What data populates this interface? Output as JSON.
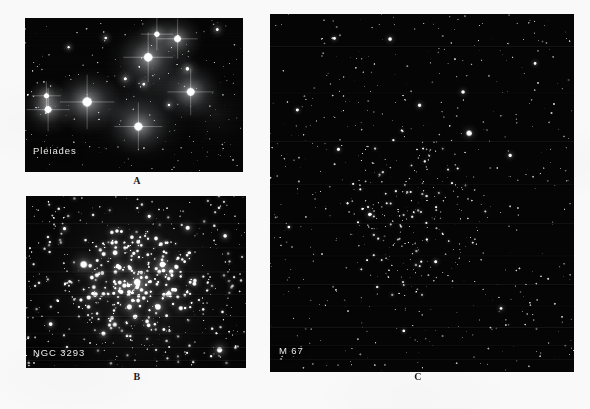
{
  "figure": {
    "kind": "astronomical-plate",
    "page_background": "#f9f9fa",
    "panel_background": "#050505",
    "label_color": "#e8e8e6",
    "caption_color": "#1c1c1c"
  },
  "panels": [
    {
      "id": "a",
      "object_label": "Pleiades",
      "caption": "A",
      "appearance": "bright blue-white stars wreathed in diffuse reflection nebulosity",
      "geometry": {
        "x": 25,
        "y": 18,
        "width": 218,
        "height": 154
      }
    },
    {
      "id": "b",
      "object_label": "NGC 3293",
      "caption": "B",
      "appearance": "rich compact open cluster, dense bright core, many resolved stars",
      "geometry": {
        "x": 26,
        "y": 196,
        "width": 220,
        "height": 172
      }
    },
    {
      "id": "c",
      "object_label": "M 67",
      "caption": "C",
      "appearance": "loose sparse old open cluster of faint pinpoint stars on dark field",
      "geometry": {
        "x": 270,
        "y": 14,
        "width": 304,
        "height": 358
      }
    }
  ],
  "starfields": {
    "pleiades": {
      "seed": 20231,
      "field_stars": 210,
      "nebulosity_opacity": 0.62,
      "bright_stars": [
        {
          "x": 0.285,
          "y": 0.545,
          "r": 5.4,
          "halo": 34,
          "spikes": true
        },
        {
          "x": 0.106,
          "y": 0.595,
          "r": 4.1,
          "halo": 27,
          "spikes": true
        },
        {
          "x": 0.098,
          "y": 0.505,
          "r": 2.9,
          "halo": 18,
          "spikes": true
        },
        {
          "x": 0.565,
          "y": 0.255,
          "r": 5.0,
          "halo": 31,
          "spikes": true
        },
        {
          "x": 0.605,
          "y": 0.105,
          "r": 3.2,
          "halo": 20,
          "spikes": true
        },
        {
          "x": 0.7,
          "y": 0.135,
          "r": 4.1,
          "halo": 25,
          "spikes": true
        },
        {
          "x": 0.76,
          "y": 0.48,
          "r": 4.6,
          "halo": 29,
          "spikes": true
        },
        {
          "x": 0.745,
          "y": 0.33,
          "r": 2.2,
          "halo": 13,
          "spikes": false
        },
        {
          "x": 0.52,
          "y": 0.705,
          "r": 4.8,
          "halo": 30,
          "spikes": true
        },
        {
          "x": 0.46,
          "y": 0.395,
          "r": 1.9,
          "halo": 10,
          "spikes": false
        },
        {
          "x": 0.545,
          "y": 0.43,
          "r": 1.7,
          "halo": 9,
          "spikes": false
        },
        {
          "x": 0.37,
          "y": 0.13,
          "r": 1.6,
          "halo": 8,
          "spikes": false
        },
        {
          "x": 0.2,
          "y": 0.19,
          "r": 1.5,
          "halo": 7,
          "spikes": false
        },
        {
          "x": 0.882,
          "y": 0.075,
          "r": 1.8,
          "halo": 9,
          "spikes": false
        },
        {
          "x": 0.66,
          "y": 0.565,
          "r": 1.6,
          "halo": 8,
          "spikes": false
        }
      ],
      "nebula_blobs": [
        {
          "x": 0.285,
          "y": 0.545,
          "rx": 0.17,
          "ry": 0.2,
          "a": 0.42
        },
        {
          "x": 0.565,
          "y": 0.265,
          "rx": 0.2,
          "ry": 0.24,
          "a": 0.4
        },
        {
          "x": 0.54,
          "y": 0.7,
          "rx": 0.21,
          "ry": 0.24,
          "a": 0.38
        },
        {
          "x": 0.76,
          "y": 0.47,
          "rx": 0.16,
          "ry": 0.19,
          "a": 0.34
        },
        {
          "x": 0.105,
          "y": 0.565,
          "rx": 0.13,
          "ry": 0.16,
          "a": 0.3
        },
        {
          "x": 0.69,
          "y": 0.14,
          "rx": 0.14,
          "ry": 0.16,
          "a": 0.28
        },
        {
          "x": 0.62,
          "y": 0.45,
          "rx": 0.3,
          "ry": 0.33,
          "a": 0.16
        },
        {
          "x": 0.43,
          "y": 0.6,
          "rx": 0.28,
          "ry": 0.26,
          "a": 0.12
        },
        {
          "x": 0.87,
          "y": 0.62,
          "rx": 0.18,
          "ry": 0.22,
          "a": 0.12
        }
      ]
    },
    "ngc3293": {
      "seed": 771,
      "field_stars": 430,
      "core": {
        "x": 0.505,
        "y": 0.505,
        "radius": 0.27,
        "count": 170
      },
      "bright_stars": [
        {
          "x": 0.505,
          "y": 0.5,
          "r": 4.0,
          "halo": 14
        },
        {
          "x": 0.262,
          "y": 0.398,
          "r": 4.3,
          "halo": 15
        },
        {
          "x": 0.62,
          "y": 0.398,
          "r": 3.5,
          "halo": 12
        },
        {
          "x": 0.6,
          "y": 0.645,
          "r": 3.6,
          "halo": 12
        },
        {
          "x": 0.47,
          "y": 0.645,
          "r": 3.2,
          "halo": 11
        },
        {
          "x": 0.405,
          "y": 0.33,
          "r": 3.0,
          "halo": 10
        },
        {
          "x": 0.66,
          "y": 0.44,
          "r": 2.8,
          "halo": 10
        },
        {
          "x": 0.88,
          "y": 0.895,
          "r": 3.4,
          "halo": 12
        },
        {
          "x": 0.352,
          "y": 0.8,
          "r": 2.6,
          "halo": 9
        },
        {
          "x": 0.735,
          "y": 0.185,
          "r": 2.6,
          "halo": 9
        },
        {
          "x": 0.112,
          "y": 0.745,
          "r": 2.4,
          "halo": 8
        },
        {
          "x": 0.905,
          "y": 0.232,
          "r": 2.3,
          "halo": 8
        },
        {
          "x": 0.175,
          "y": 0.19,
          "r": 2.1,
          "halo": 7
        },
        {
          "x": 0.56,
          "y": 0.118,
          "r": 2.0,
          "halo": 7
        }
      ]
    },
    "m67": {
      "seed": 4457,
      "field_stars": 560,
      "core": {
        "x": 0.47,
        "y": 0.56,
        "radius": 0.24,
        "count": 190
      },
      "bright_stars": [
        {
          "x": 0.655,
          "y": 0.333,
          "r": 3.6,
          "halo": 10
        },
        {
          "x": 0.395,
          "y": 0.07,
          "r": 2.4,
          "halo": 7
        },
        {
          "x": 0.635,
          "y": 0.218,
          "r": 2.3,
          "halo": 7
        },
        {
          "x": 0.492,
          "y": 0.255,
          "r": 2.2,
          "halo": 7
        },
        {
          "x": 0.79,
          "y": 0.395,
          "r": 2.2,
          "halo": 7
        },
        {
          "x": 0.225,
          "y": 0.378,
          "r": 2.1,
          "halo": 6
        },
        {
          "x": 0.328,
          "y": 0.56,
          "r": 2.2,
          "halo": 7
        },
        {
          "x": 0.09,
          "y": 0.268,
          "r": 2.0,
          "halo": 6
        },
        {
          "x": 0.872,
          "y": 0.138,
          "r": 1.9,
          "halo": 6
        },
        {
          "x": 0.545,
          "y": 0.692,
          "r": 2.0,
          "halo": 6
        },
        {
          "x": 0.212,
          "y": 0.068,
          "r": 1.9,
          "halo": 6
        },
        {
          "x": 0.76,
          "y": 0.822,
          "r": 1.9,
          "halo": 6
        },
        {
          "x": 0.44,
          "y": 0.885,
          "r": 1.8,
          "halo": 5
        },
        {
          "x": 0.062,
          "y": 0.595,
          "r": 1.8,
          "halo": 5
        }
      ]
    }
  },
  "scanlines": {
    "panel_b": [
      0.16,
      0.3,
      0.44,
      0.57,
      0.7,
      0.8,
      0.88,
      0.955
    ],
    "panel_c": [
      0.09,
      0.22,
      0.355,
      0.475,
      0.585,
      0.675,
      0.755,
      0.815,
      0.875,
      0.925,
      0.965
    ]
  }
}
